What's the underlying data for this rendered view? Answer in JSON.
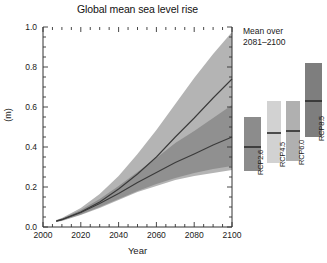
{
  "chart_data": {
    "type": "area",
    "title": "Global mean sea level rise",
    "xlabel": "Year",
    "ylabel": "(m)",
    "xlim": [
      2000,
      2100
    ],
    "ylim": [
      0.0,
      1.0
    ],
    "xticks": [
      2000,
      2020,
      2040,
      2060,
      2080,
      2100
    ],
    "xtick_labels": [
      "2000",
      "2020",
      "2040",
      "2060",
      "2080",
      "2100"
    ],
    "yticks": [
      0.0,
      0.2,
      0.4,
      0.6,
      0.8,
      1.0
    ],
    "ytick_labels": [
      "0.0",
      "0.2",
      "0.4",
      "0.6",
      "0.8",
      "1.0"
    ],
    "grid": false,
    "legend_position": "right-panel",
    "x": [
      2007,
      2010,
      2020,
      2030,
      2040,
      2050,
      2060,
      2070,
      2080,
      2090,
      2100
    ],
    "series": [
      {
        "name": "RCP8.5",
        "role": "band-upper",
        "color": "#b4b4b4",
        "values": [
          0.035,
          0.045,
          0.095,
          0.165,
          0.255,
          0.365,
          0.485,
          0.615,
          0.745,
          0.865,
          0.975
        ]
      },
      {
        "name": "RCP8.5",
        "role": "band-lower",
        "color": "#b4b4b4",
        "values": [
          0.025,
          0.03,
          0.06,
          0.095,
          0.135,
          0.175,
          0.205,
          0.235,
          0.255,
          0.27,
          0.285
        ]
      },
      {
        "name": "RCP8.5",
        "role": "median",
        "color": "#3a3a3a",
        "values": [
          0.03,
          0.038,
          0.075,
          0.125,
          0.19,
          0.265,
          0.35,
          0.45,
          0.545,
          0.645,
          0.74
        ]
      },
      {
        "name": "RCP2.6",
        "role": "band-upper",
        "color": "#8a8a8a",
        "values": [
          0.033,
          0.042,
          0.085,
          0.14,
          0.205,
          0.275,
          0.345,
          0.42,
          0.48,
          0.545,
          0.61
        ]
      },
      {
        "name": "RCP2.6",
        "role": "band-lower",
        "color": "#8a8a8a",
        "values": [
          0.026,
          0.032,
          0.062,
          0.1,
          0.14,
          0.18,
          0.215,
          0.245,
          0.27,
          0.29,
          0.305
        ]
      },
      {
        "name": "RCP2.6",
        "role": "median",
        "color": "#3a3a3a",
        "values": [
          0.029,
          0.036,
          0.072,
          0.118,
          0.168,
          0.222,
          0.272,
          0.322,
          0.365,
          0.41,
          0.45
        ]
      }
    ]
  },
  "side_panel": {
    "title_line1": "Mean over",
    "title_line2": "2081–2100",
    "bars": [
      {
        "label": "RCP2.6",
        "low": 0.28,
        "high": 0.55,
        "median": 0.4,
        "color": "#8c8c8c"
      },
      {
        "label": "RCP4.5",
        "low": 0.32,
        "high": 0.63,
        "median": 0.47,
        "color": "#d2d2d2"
      },
      {
        "label": "RCP6.0",
        "low": 0.33,
        "high": 0.63,
        "median": 0.48,
        "color": "#b0b0b0"
      },
      {
        "label": "RCP8.5",
        "low": 0.45,
        "high": 0.82,
        "median": 0.63,
        "color": "#7e7e7e"
      }
    ]
  }
}
